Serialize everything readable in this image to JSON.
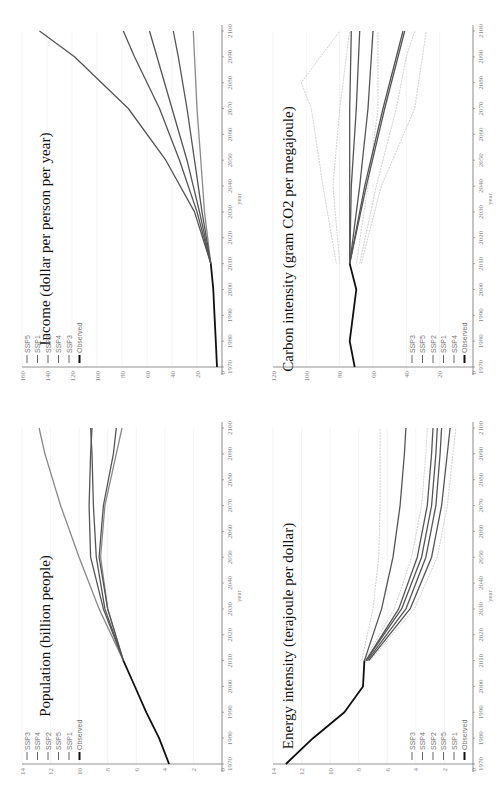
{
  "chart_data": [
    {
      "id": "population",
      "type": "line",
      "title": "Population (billion people)",
      "xlabel": "year",
      "ylabel": "",
      "xlim": [
        1970,
        2100
      ],
      "ylim": [
        0,
        14
      ],
      "x_ticks": [
        1970,
        1980,
        1990,
        2000,
        2010,
        2020,
        2030,
        2040,
        2050,
        2060,
        2070,
        2080,
        2090,
        2100
      ],
      "y_ticks": [
        0,
        2,
        4,
        6,
        8,
        10,
        12,
        14
      ],
      "grid": true,
      "legend": [
        "SSP3",
        "SSP4",
        "SSP2",
        "SSP5",
        "SSP1",
        "Observed"
      ],
      "legend_position": "upper-left",
      "series": [
        {
          "name": "Observed",
          "x": [
            1970,
            1980,
            1990,
            2000,
            2010
          ],
          "values": [
            3.7,
            4.4,
            5.3,
            6.1,
            6.9
          ],
          "style": "black"
        },
        {
          "name": "SSP3",
          "x": [
            2010,
            2030,
            2050,
            2070,
            2090,
            2100
          ],
          "values": [
            6.9,
            8.6,
            10.0,
            11.3,
            12.4,
            12.8
          ],
          "style": "gray"
        },
        {
          "name": "SSP4",
          "x": [
            2010,
            2030,
            2050,
            2070,
            2090,
            2100
          ],
          "values": [
            6.9,
            8.2,
            8.8,
            9.0,
            9.1,
            9.2
          ],
          "style": "dark"
        },
        {
          "name": "SSP2",
          "x": [
            2010,
            2030,
            2050,
            2070,
            2090,
            2100
          ],
          "values": [
            6.9,
            8.3,
            9.2,
            9.3,
            9.2,
            9.1
          ],
          "style": "dark"
        },
        {
          "name": "SSP5",
          "x": [
            2010,
            2030,
            2050,
            2070,
            2090,
            2100
          ],
          "values": [
            6.9,
            8.0,
            8.6,
            8.3,
            7.6,
            7.4
          ],
          "style": "dark"
        },
        {
          "name": "SSP1",
          "x": [
            2010,
            2030,
            2050,
            2070,
            2090,
            2100
          ],
          "values": [
            6.9,
            8.0,
            8.5,
            8.2,
            7.4,
            7.0
          ],
          "style": "gray"
        }
      ]
    },
    {
      "id": "income",
      "type": "line",
      "title": "Income (dollar per person per year)",
      "xlabel": "year",
      "ylabel": "",
      "xlim": [
        1970,
        2100
      ],
      "ylim": [
        0,
        160
      ],
      "x_ticks": [
        1970,
        1980,
        1990,
        2000,
        2010,
        2020,
        2030,
        2040,
        2050,
        2060,
        2070,
        2080,
        2090,
        2100
      ],
      "y_ticks": [
        0,
        20,
        40,
        60,
        80,
        100,
        120,
        140,
        160
      ],
      "grid": true,
      "legend": [
        "SSP5",
        "SSP1",
        "SSP2",
        "SSP4",
        "SSP3",
        "Observed"
      ],
      "legend_position": "upper-left",
      "series": [
        {
          "name": "Observed",
          "x": [
            1970,
            1980,
            1990,
            2000,
            2010
          ],
          "values": [
            4,
            5,
            6,
            7,
            9
          ],
          "style": "black"
        },
        {
          "name": "SSP5",
          "x": [
            2010,
            2030,
            2050,
            2070,
            2090,
            2100
          ],
          "values": [
            9,
            22,
            45,
            75,
            118,
            146
          ],
          "style": "dark"
        },
        {
          "name": "SSP1",
          "x": [
            2010,
            2030,
            2050,
            2070,
            2090,
            2100
          ],
          "values": [
            9,
            20,
            34,
            50,
            70,
            79
          ],
          "style": "dark"
        },
        {
          "name": "SSP2",
          "x": [
            2010,
            2030,
            2050,
            2070,
            2090,
            2100
          ],
          "values": [
            9,
            18,
            28,
            40,
            52,
            58
          ],
          "style": "dark"
        },
        {
          "name": "SSP4",
          "x": [
            2010,
            2030,
            2050,
            2070,
            2090,
            2100
          ],
          "values": [
            9,
            16,
            22,
            28,
            35,
            39
          ],
          "style": "dark"
        },
        {
          "name": "SSP3",
          "x": [
            2010,
            2030,
            2050,
            2070,
            2090,
            2100
          ],
          "values": [
            9,
            14,
            17,
            20,
            22,
            23
          ],
          "style": "gray"
        }
      ]
    },
    {
      "id": "energy_intensity",
      "type": "line",
      "title": "Energy intensity (terajoule per dollar)",
      "xlabel": "year",
      "ylabel": "",
      "xlim": [
        1970,
        2100
      ],
      "ylim": [
        0,
        14
      ],
      "x_ticks": [
        1970,
        1980,
        1990,
        2000,
        2010,
        2020,
        2030,
        2040,
        2050,
        2060,
        2070,
        2080,
        2090,
        2100
      ],
      "y_ticks": [
        0,
        2,
        4,
        6,
        8,
        10,
        12,
        14
      ],
      "grid": true,
      "legend": [
        "SSP3",
        "SSP4",
        "SSP2",
        "SSP5",
        "SSP1",
        "Observed"
      ],
      "legend_position": "lower-left",
      "series": [
        {
          "name": "Observed",
          "x": [
            1970,
            1980,
            1990,
            2000,
            2010
          ],
          "values": [
            13.1,
            11.2,
            9.0,
            7.7,
            7.6
          ],
          "style": "black"
        },
        {
          "name": "SSP3",
          "x": [
            2010,
            2030,
            2050,
            2070,
            2090,
            2100
          ],
          "values": [
            7.6,
            6.4,
            5.6,
            5.1,
            4.8,
            4.7
          ],
          "style": "dark"
        },
        {
          "name": "SSP3 band",
          "x": [
            2010,
            2030,
            2050,
            2070,
            2090,
            2100
          ],
          "values": [
            7.8,
            7.0,
            6.6,
            6.5,
            6.5,
            6.5
          ],
          "style": "light"
        },
        {
          "name": "SSP4",
          "x": [
            2010,
            2030,
            2050,
            2070,
            2090,
            2100
          ],
          "values": [
            7.5,
            5.2,
            3.9,
            3.2,
            2.9,
            2.8
          ],
          "style": "dark"
        },
        {
          "name": "SSP2",
          "x": [
            2010,
            2030,
            2050,
            2070,
            2090,
            2100
          ],
          "values": [
            7.5,
            5.0,
            3.6,
            2.9,
            2.6,
            2.5
          ],
          "style": "dark"
        },
        {
          "name": "SSP5",
          "x": [
            2010,
            2030,
            2050,
            2070,
            2090,
            2100
          ],
          "values": [
            7.4,
            4.7,
            3.3,
            2.6,
            2.3,
            2.2
          ],
          "style": "dark"
        },
        {
          "name": "SSP1",
          "x": [
            2010,
            2030,
            2050,
            2070,
            2090,
            2100
          ],
          "values": [
            7.3,
            4.4,
            2.9,
            2.2,
            1.8,
            1.6
          ],
          "style": "dark"
        },
        {
          "name": "band low",
          "x": [
            2010,
            2030,
            2050,
            2070,
            2090,
            2100
          ],
          "values": [
            7.2,
            4.1,
            2.5,
            1.8,
            1.4,
            1.2
          ],
          "style": "light"
        },
        {
          "name": "band mid",
          "x": [
            2010,
            2030,
            2050,
            2070,
            2090,
            2100
          ],
          "values": [
            7.6,
            5.5,
            4.3,
            3.6,
            3.3,
            3.2
          ],
          "style": "light"
        }
      ]
    },
    {
      "id": "carbon_intensity",
      "type": "line",
      "title": "Carbon intensity (gram CO2 per megajoule)",
      "xlabel": "year",
      "ylabel": "",
      "xlim": [
        1970,
        2100
      ],
      "ylim": [
        0,
        120
      ],
      "x_ticks": [
        1970,
        1980,
        1990,
        2000,
        2010,
        2020,
        2030,
        2040,
        2050,
        2060,
        2070,
        2080,
        2090,
        2100
      ],
      "y_ticks": [
        0,
        20,
        40,
        60,
        80,
        100,
        120
      ],
      "grid": true,
      "legend": [
        "SSP3",
        "SSP5",
        "SSP2",
        "SSP1",
        "SSP4",
        "Observed"
      ],
      "legend_position": "lower-left",
      "series": [
        {
          "name": "Observed",
          "x": [
            1970,
            1980,
            1990,
            2000,
            2010
          ],
          "values": [
            71,
            74,
            72,
            70,
            74
          ],
          "style": "black"
        },
        {
          "name": "SSP3",
          "x": [
            2010,
            2040,
            2070,
            2100
          ],
          "values": [
            74,
            74,
            74,
            73
          ],
          "style": "dark"
        },
        {
          "name": "SSP5",
          "x": [
            2010,
            2040,
            2070,
            2100
          ],
          "values": [
            74,
            73,
            70,
            68
          ],
          "style": "dark"
        },
        {
          "name": "SSP2",
          "x": [
            2010,
            2040,
            2070,
            2100
          ],
          "values": [
            74,
            68,
            63,
            60
          ],
          "style": "dark"
        },
        {
          "name": "SSP1",
          "x": [
            2010,
            2040,
            2070,
            2100
          ],
          "values": [
            74,
            65,
            54,
            42
          ],
          "style": "dark"
        },
        {
          "name": "SSP4",
          "x": [
            2010,
            2040,
            2070,
            2100
          ],
          "values": [
            74,
            64,
            53,
            41
          ],
          "style": "dark"
        },
        {
          "name": "band high",
          "x": [
            2010,
            2040,
            2070,
            2080,
            2100
          ],
          "values": [
            82,
            90,
            97,
            103,
            80
          ],
          "style": "light"
        },
        {
          "name": "band high2",
          "x": [
            2010,
            2040,
            2070,
            2100
          ],
          "values": [
            80,
            84,
            80,
            74
          ],
          "style": "light"
        },
        {
          "name": "band mid",
          "x": [
            2010,
            2040,
            2070,
            2100
          ],
          "values": [
            70,
            63,
            57,
            57
          ],
          "style": "light"
        },
        {
          "name": "band low",
          "x": [
            2010,
            2040,
            2070,
            2090,
            2100
          ],
          "values": [
            68,
            58,
            46,
            40,
            35
          ],
          "style": "light"
        },
        {
          "name": "band lowest",
          "x": [
            2010,
            2040,
            2070,
            2100
          ],
          "values": [
            67,
            55,
            35,
            28
          ],
          "style": "light"
        }
      ]
    }
  ]
}
